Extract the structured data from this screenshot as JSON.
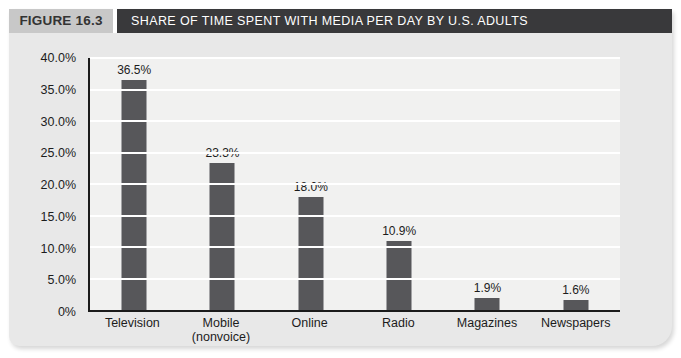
{
  "figure": {
    "label": "FIGURE 16.3",
    "title": "SHARE OF TIME SPENT WITH MEDIA PER DAY BY U.S. ADULTS"
  },
  "chart_data": {
    "type": "bar",
    "title": "SHARE OF TIME SPENT WITH MEDIA PER DAY BY U.S. ADULTS",
    "categories": [
      "Television",
      "Mobile\n(nonvoice)",
      "Online",
      "Radio",
      "Magazines",
      "Newspapers"
    ],
    "values": [
      36.5,
      23.3,
      18.0,
      10.9,
      1.9,
      1.6
    ],
    "bar_labels": [
      "36.5%",
      "23.3%",
      "18.0%",
      "10.9%",
      "1.9%",
      "1.6%"
    ],
    "xlabel": "",
    "ylabel": "",
    "ylim": [
      0,
      40
    ],
    "ytick_values": [
      0,
      5,
      10,
      15,
      20,
      25,
      30,
      35,
      40
    ],
    "ytick_labels": [
      "0%",
      "5.0%",
      "10.0%",
      "15.0%",
      "20.0%",
      "25.0%",
      "30.0%",
      "35.0%",
      "40.0%"
    ],
    "grid": "horizontal",
    "legend": "none",
    "bar_color": "#57575a"
  },
  "colors": {
    "page_background": "#ffffff",
    "card_background": "#e8e8e8",
    "plot_background": "#f1f1f0",
    "gridline": "#ffffff",
    "bar": "#57575a",
    "axis": "#1b1b1b",
    "header_band": "#39393b",
    "header_band_text": "#ffffff",
    "figure_label_background": "#c8c8c8",
    "figure_label_text": "#333333",
    "text": "#1c1c1c"
  }
}
